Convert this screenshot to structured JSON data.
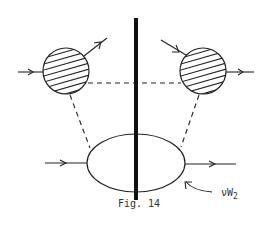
{
  "figure": {
    "caption": "Fig. 14",
    "label_main": "νW",
    "label_sub": "2"
  },
  "colors": {
    "stroke": "#222222",
    "background": "#ffffff"
  },
  "diagram": {
    "cut_line": {
      "x": 136,
      "y1": 18,
      "y2": 200,
      "width": 4
    },
    "blobs": [
      {
        "name": "left-hatched-blob",
        "cx": 66,
        "cy": 71,
        "r": 23,
        "hatched": true
      },
      {
        "name": "right-hatched-blob",
        "cx": 203,
        "cy": 71,
        "r": 23,
        "hatched": true
      }
    ],
    "ellipse": {
      "cx": 136,
      "cy": 163,
      "rx": 49,
      "ry": 29
    },
    "dashed_lines": [
      "left-blob-to-ellipse",
      "right-blob-to-ellipse",
      "blob-to-blob-horizontal"
    ],
    "arrows": [
      "incoming-left-blob",
      "outgoing-left-blob",
      "incoming-right-blob",
      "outgoing-right-blob",
      "incoming-ellipse",
      "outgoing-ellipse",
      "label-pointer"
    ]
  }
}
